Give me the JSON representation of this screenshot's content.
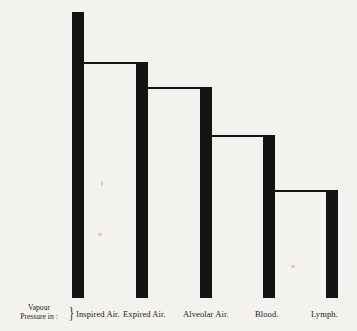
{
  "figure": {
    "axis_caption_line1": "Vapour",
    "axis_caption_line2": "Pressure in :",
    "brace_glyph": "}",
    "ink_color": "#131313",
    "paper_color": "#f4f2ee"
  },
  "chart_data": {
    "type": "bar",
    "title": "",
    "subtitle": "",
    "xlabel": "Vapour Pressure in :",
    "ylabel": "",
    "categories": [
      "Inspired Air.",
      "Expired Air.",
      "Alveolar Air.",
      "Blood.",
      "Lymph."
    ],
    "values": [
      100,
      82,
      73,
      57,
      37
    ],
    "value_unit": "relative vapour pressure",
    "ylim": [
      0,
      100
    ],
    "grid": false,
    "legend": null,
    "annotations": [],
    "style_notes": "descending staircase of thick vertical bars joined by thin horizontal lines at each bar top",
    "bar_tops_px": [
      12,
      63,
      88,
      136,
      191
    ],
    "baseline_px": 298,
    "bar_centers_px": [
      78,
      142,
      206,
      269,
      332
    ],
    "bar_width_px": 12
  },
  "labels": [
    {
      "text": "Inspired Air.",
      "left": 76
    },
    {
      "text": "Expired Air.",
      "left": 123
    },
    {
      "text": "Alveolar Air.",
      "left": 183
    },
    {
      "text": "Blood.",
      "left": 255
    },
    {
      "text": "Lymph.",
      "left": 311
    }
  ]
}
